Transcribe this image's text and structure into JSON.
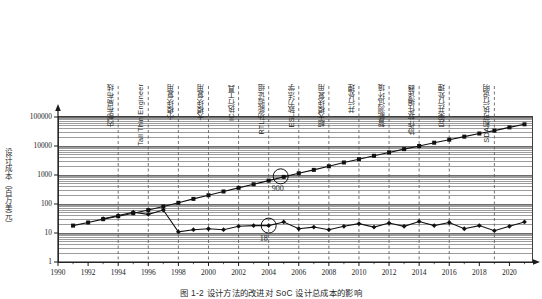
{
  "figure": {
    "caption": "图 1-2   设计方法的改进对 SoC 设计总成本的影响"
  },
  "chart_data": {
    "type": "line",
    "title": "",
    "xlabel": "",
    "ylabel": "设计成本（百万美元）",
    "yscale": "log",
    "ylim": [
      1,
      200000
    ],
    "xlim": [
      1990,
      2021.5
    ],
    "grid": "horizontal-log-minor",
    "legend": "none",
    "y_ticks": [
      "1",
      "10",
      "100",
      "1000",
      "10000",
      "100000"
    ],
    "y_tick_values": [
      1,
      10,
      100,
      1000,
      10000,
      100000
    ],
    "x_ticks": [
      "1990",
      "1992",
      "1994",
      "1996",
      "1998",
      "2000",
      "2002",
      "2004",
      "2006",
      "2008",
      "2010",
      "2012",
      "2014",
      "2016",
      "2018",
      "2020"
    ],
    "x_tick_values": [
      1990,
      1992,
      1994,
      1996,
      1998,
      2000,
      2002,
      2004,
      2006,
      2008,
      2010,
      2012,
      2014,
      2016,
      2018,
      2020
    ],
    "series": [
      {
        "name": "无设计方法改进的总成本",
        "marker": "square",
        "color": "#111111",
        "x": [
          1991,
          1992,
          1993,
          1994,
          1995,
          1996,
          1997,
          1998,
          1999,
          2000,
          2001,
          2002,
          2003,
          2004,
          2005,
          2006,
          2007,
          2008,
          2009,
          2010,
          2011,
          2012,
          2013,
          2014,
          2015,
          2016,
          2017,
          2018,
          2019,
          2020,
          2021
        ],
        "y": [
          18,
          23,
          30,
          38,
          48,
          62,
          82,
          110,
          150,
          200,
          270,
          360,
          480,
          640,
          860,
          1150,
          1500,
          2000,
          2700,
          3500,
          4600,
          6000,
          7800,
          10000,
          13000,
          16500,
          21000,
          27000,
          34000,
          44000,
          56000
        ]
      },
      {
        "name": "采用设计方法改进后的总成本",
        "marker": "diamond",
        "color": "#111111",
        "x": [
          1993,
          1994,
          1995,
          1996,
          1997,
          1998,
          1999,
          2000,
          2001,
          2002,
          2003,
          2004,
          2005,
          2006,
          2007,
          2008,
          2009,
          2010,
          2011,
          2012,
          2013,
          2014,
          2015,
          2016,
          2017,
          2018,
          2019,
          2020,
          2021
        ],
        "y": [
          31,
          40,
          52,
          44,
          62,
          11,
          13,
          14,
          13,
          17,
          18,
          18,
          24,
          14,
          16,
          13,
          17,
          21,
          16,
          22,
          17,
          25,
          18,
          23,
          14,
          18,
          12,
          17,
          24
        ]
      }
    ],
    "annotations": [
      {
        "label": "900",
        "x": 2004.8,
        "y": 900,
        "series": "无设计方法改进的总成本",
        "marker": "circle-callout"
      },
      {
        "label": "18",
        "x": 2004.0,
        "y": 18,
        "series": "采用设计方法改进后的总成本",
        "marker": "circle-callout"
      }
    ],
    "milestones": [
      {
        "label": "内部布局布线",
        "x": 1994.0
      },
      {
        "label": "Tall Thin Engineer",
        "x": 1996.0
      },
      {
        "label": "小模块复用",
        "x": 1998.0
      },
      {
        "label": "大模块复用",
        "x": 2000.0
      },
      {
        "label": "IC执行工具",
        "x": 2002.0
      },
      {
        "label": "RTL功能验证组",
        "x": 2004.0
      },
      {
        "label": "ESL致力法学",
        "x": 2006.0
      },
      {
        "label": "超大模块复用",
        "x": 2008.0
      },
      {
        "label": "并行处理",
        "x": 2010.0
      },
      {
        "label": "智能测试环境",
        "x": 2012.0
      },
      {
        "label": "协作软件编译器",
        "x": 2014.0
      },
      {
        "label": "异案并行处理",
        "x": 2016.0
      },
      {
        "label": "SDA和可执行说明",
        "x": 2019.0
      }
    ]
  }
}
